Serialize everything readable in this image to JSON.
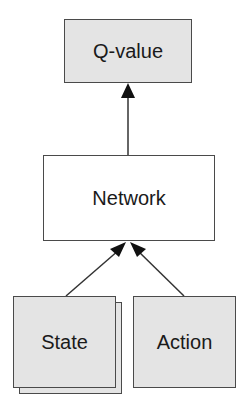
{
  "diagram": {
    "nodes": {
      "q_value": {
        "label": "Q-value",
        "fill": "#e4e4e4"
      },
      "network": {
        "label": "Network",
        "fill": "#ffffff"
      },
      "state": {
        "label": "State",
        "fill": "#e4e4e4",
        "stacked": true
      },
      "action": {
        "label": "Action",
        "fill": "#e4e4e4"
      }
    },
    "edges": [
      {
        "from": "network",
        "to": "q_value"
      },
      {
        "from": "state",
        "to": "network"
      },
      {
        "from": "action",
        "to": "network"
      }
    ],
    "colors": {
      "stroke": "#4a4a4a",
      "arrow": "#111111"
    }
  }
}
